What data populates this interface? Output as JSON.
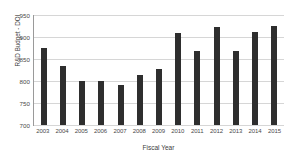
{
  "chart_data": {
    "type": "bar",
    "title": "",
    "xlabel": "Fiscal Year",
    "ylabel": "R&D Budget - DOI",
    "categories": [
      "2003",
      "2004",
      "2005",
      "2006",
      "2007",
      "2008",
      "2009",
      "2010",
      "2011",
      "2012",
      "2013",
      "2014",
      "2015"
    ],
    "values": [
      876,
      834,
      801,
      800,
      790,
      814,
      827,
      908,
      869,
      923,
      869,
      911,
      925
    ],
    "ylim": [
      700,
      950
    ],
    "yticks": [
      700,
      750,
      800,
      850,
      900,
      950
    ],
    "ytick_labels": [
      "700",
      "750",
      "800",
      "850",
      "900",
      "950"
    ],
    "grid": true,
    "legend": "none",
    "series": [
      {
        "name": "R&D Budget - DOI",
        "color": "#2e2e2e",
        "values": [
          876,
          834,
          801,
          800,
          790,
          814,
          827,
          908,
          869,
          923,
          869,
          911,
          925
        ]
      }
    ]
  }
}
